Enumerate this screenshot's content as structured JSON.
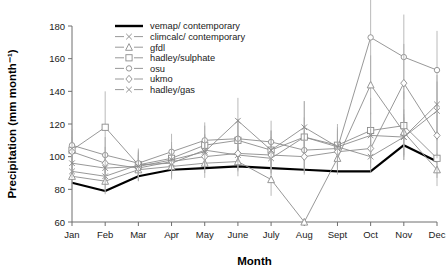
{
  "chart_data": {
    "type": "line",
    "title": "",
    "xlabel": "Month",
    "ylabel": "Precipitation (mm month⁻¹)",
    "categories": [
      "Jan",
      "Feb",
      "Mar",
      "Apr",
      "May",
      "June",
      "July",
      "Aug",
      "Sept",
      "Oct",
      "Nov",
      "Dec"
    ],
    "ylim": [
      60,
      180
    ],
    "yticks": [
      60,
      80,
      100,
      120,
      140,
      160,
      180
    ],
    "grid": false,
    "legend_position": "top-center",
    "series": [
      {
        "name": "vemap/ contemporary",
        "marker": "none",
        "color": "#000000",
        "linewidth": 2.2,
        "values": [
          84,
          79,
          88,
          92,
          93,
          94,
          93,
          92,
          91,
          91,
          107,
          97
        ],
        "errors": [
          0,
          0,
          0,
          0,
          0,
          0,
          0,
          0,
          0,
          0,
          0,
          0
        ]
      },
      {
        "name": "climcalc/ contemporary",
        "marker": "x",
        "color": "#8c8c8c",
        "linewidth": 0.9,
        "values": [
          91,
          88,
          95,
          96,
          104,
          101,
          99,
          112,
          106,
          100,
          112,
          128
        ],
        "errors": [
          9,
          10,
          8,
          9,
          10,
          9,
          10,
          12,
          10,
          10,
          12,
          18
        ]
      },
      {
        "name": "gfdl",
        "marker": "triangle",
        "color": "#8c8c8c",
        "linewidth": 0.9,
        "values": [
          88,
          85,
          92,
          94,
          96,
          97,
          86,
          60,
          99,
          144,
          115,
          92
        ],
        "errors": [
          8,
          8,
          7,
          8,
          9,
          9,
          10,
          0,
          10,
          18,
          14,
          10
        ]
      },
      {
        "name": "hadley/sulphate",
        "marker": "square",
        "color": "#8c8c8c",
        "linewidth": 0.9,
        "values": [
          104,
          118,
          95,
          99,
          107,
          110,
          104,
          112,
          107,
          116,
          119,
          99
        ],
        "errors": [
          12,
          22,
          9,
          10,
          12,
          13,
          12,
          22,
          13,
          20,
          21,
          12
        ]
      },
      {
        "name": "osu",
        "marker": "circle",
        "color": "#8c8c8c",
        "linewidth": 0.9,
        "values": [
          107,
          101,
          96,
          103,
          110,
          111,
          109,
          104,
          105,
          173,
          161,
          153
        ],
        "errors": [
          10,
          11,
          9,
          11,
          11,
          12,
          13,
          12,
          12,
          28,
          26,
          24
        ]
      },
      {
        "name": "ukmo",
        "marker": "diamond",
        "color": "#8c8c8c",
        "linewidth": 0.9,
        "values": [
          103,
          96,
          93,
          97,
          100,
          102,
          101,
          100,
          103,
          105,
          145,
          113
        ],
        "errors": [
          9,
          10,
          8,
          9,
          10,
          11,
          11,
          11,
          11,
          12,
          24,
          14
        ]
      },
      {
        "name": "hadley/gas",
        "marker": "x",
        "color": "#8c8c8c",
        "linewidth": 0.9,
        "values": [
          96,
          93,
          94,
          98,
          103,
          122,
          104,
          118,
          106,
          113,
          112,
          132
        ],
        "errors": [
          9,
          10,
          8,
          9,
          10,
          14,
          12,
          16,
          12,
          14,
          14,
          18
        ]
      }
    ]
  },
  "axes": {
    "y_title": "Precipitation (mm month⁻¹)",
    "x_title": "Month"
  },
  "legend": {
    "items": [
      {
        "label": "vemap/ contemporary",
        "marker": "none",
        "color": "#000000"
      },
      {
        "label": "climcalc/ contemporary",
        "marker": "x",
        "color": "#8c8c8c"
      },
      {
        "label": "gfdl",
        "marker": "triangle",
        "color": "#8c8c8c"
      },
      {
        "label": "hadley/sulphate",
        "marker": "square",
        "color": "#8c8c8c"
      },
      {
        "label": "osu",
        "marker": "circle",
        "color": "#8c8c8c"
      },
      {
        "label": "ukmo",
        "marker": "diamond",
        "color": "#8c8c8c"
      },
      {
        "label": "hadley/gas",
        "marker": "x",
        "color": "#8c8c8c"
      }
    ]
  }
}
